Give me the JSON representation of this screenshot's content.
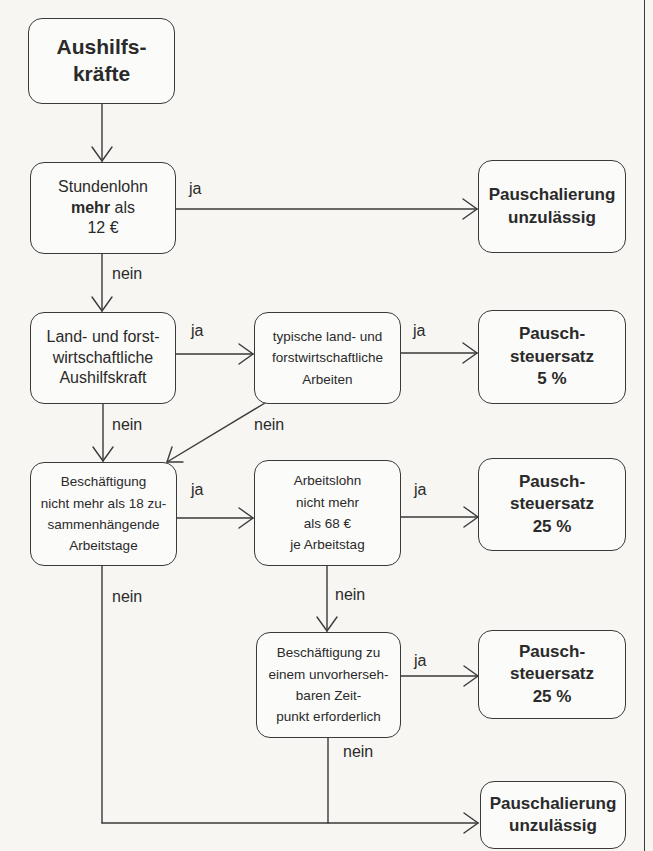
{
  "diagram": {
    "type": "flowchart",
    "nodes": {
      "start": {
        "lines": [
          "Aushilfs-",
          "kräfte"
        ]
      },
      "hourly_wage": {
        "line1": "Stundenlohn",
        "line2_bold": "mehr",
        "line2_rest": " als",
        "line3": "12 €"
      },
      "result_not_allowed_1": {
        "lines": [
          "Pauschalierung",
          "unzulässig"
        ]
      },
      "agri_worker": {
        "lines": [
          "Land- und forst-",
          "wirtschaftliche",
          "Aushilfskraft"
        ]
      },
      "typical_agri_work": {
        "lines": [
          "typische land- und",
          "forstwirtschaftliche",
          "Arbeiten"
        ]
      },
      "result_5": {
        "lines": [
          "Pausch-",
          "steuersatz",
          "5 %"
        ]
      },
      "max_18_days": {
        "lines": [
          "Beschäftigung",
          "nicht mehr als 18 zu-",
          "sammenhängende",
          "Arbeitstage"
        ]
      },
      "wage_68": {
        "lines": [
          "Arbeitslohn",
          "nicht mehr",
          "als 68 €",
          "je Arbeitstag"
        ]
      },
      "result_25_a": {
        "lines": [
          "Pausch-",
          "steuersatz",
          "25 %"
        ]
      },
      "unforeseen": {
        "lines": [
          "Beschäftigung zu",
          "einem unvorherseh-",
          "baren Zeit-",
          "punkt erforderlich"
        ]
      },
      "result_25_b": {
        "lines": [
          "Pausch-",
          "steuersatz",
          "25 %"
        ]
      },
      "result_not_allowed_2": {
        "lines": [
          "Pauschalierung",
          "unzulässig"
        ]
      }
    },
    "edge_labels": {
      "hourly_yes": "ja",
      "hourly_no": "nein",
      "agri_yes": "ja",
      "agri_no": "nein",
      "typical_yes": "ja",
      "typical_no": "nein",
      "days_yes": "ja",
      "days_no": "nein",
      "wage68_yes": "ja",
      "wage68_no": "nein",
      "unforeseen_yes": "ja",
      "unforeseen_no": "nein"
    },
    "edges": [
      {
        "from": "start",
        "to": "hourly_wage",
        "label": ""
      },
      {
        "from": "hourly_wage",
        "to": "result_not_allowed_1",
        "label": "ja"
      },
      {
        "from": "hourly_wage",
        "to": "agri_worker",
        "label": "nein"
      },
      {
        "from": "agri_worker",
        "to": "typical_agri_work",
        "label": "ja"
      },
      {
        "from": "agri_worker",
        "to": "max_18_days",
        "label": "nein"
      },
      {
        "from": "typical_agri_work",
        "to": "result_5",
        "label": "ja"
      },
      {
        "from": "typical_agri_work",
        "to": "max_18_days",
        "label": "nein"
      },
      {
        "from": "max_18_days",
        "to": "wage_68",
        "label": "ja"
      },
      {
        "from": "max_18_days",
        "to": "result_not_allowed_2",
        "label": "nein"
      },
      {
        "from": "wage_68",
        "to": "result_25_a",
        "label": "ja"
      },
      {
        "from": "wage_68",
        "to": "unforeseen",
        "label": "nein"
      },
      {
        "from": "unforeseen",
        "to": "result_25_b",
        "label": "ja"
      },
      {
        "from": "unforeseen",
        "to": "result_not_allowed_2",
        "label": "nein"
      }
    ]
  },
  "colors": {
    "stroke": "#3a3a3a",
    "text": "#2a2a2a",
    "background": "#f7f6f3"
  }
}
